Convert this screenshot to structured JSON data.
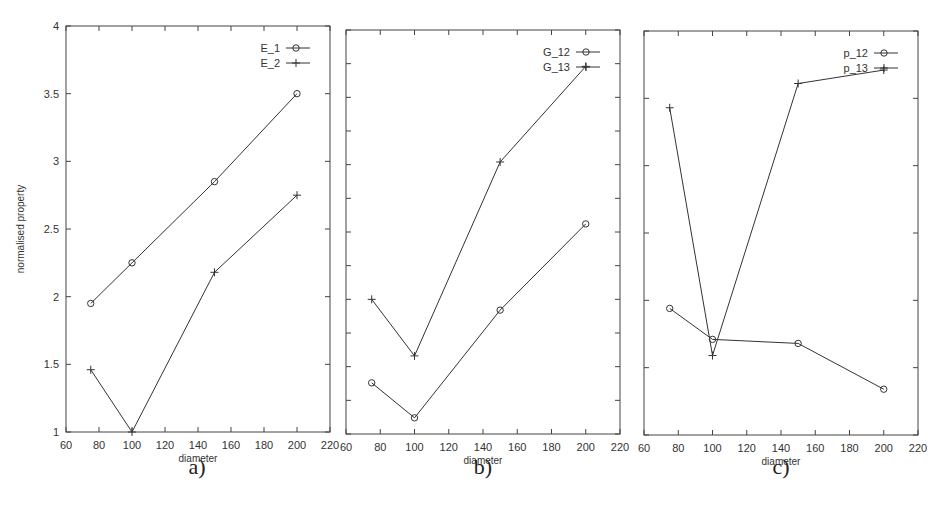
{
  "figure": {
    "panel_labels": [
      "a)",
      "b)",
      "c)"
    ],
    "xlabel": "diameter",
    "ylabel": "normalised property"
  },
  "chart_data": [
    {
      "type": "line",
      "panel": "a)",
      "title": "",
      "xlabel": "diameter",
      "ylabel": "normalised property",
      "xlim": [
        60,
        220
      ],
      "ylim": [
        1,
        4
      ],
      "x_ticks": [
        60,
        80,
        100,
        120,
        140,
        160,
        180,
        200,
        220
      ],
      "y_ticks": [
        1,
        1.5,
        2,
        2.5,
        3,
        3.5,
        4
      ],
      "y_tick_labels": [
        "1",
        "1.5",
        "2",
        "2.5",
        "3",
        "3.5",
        "4"
      ],
      "x": [
        75,
        100,
        150,
        200
      ],
      "series": [
        {
          "name": "E_1",
          "marker": "circle",
          "values": [
            1.95,
            2.25,
            2.85,
            3.5
          ]
        },
        {
          "name": "E_2",
          "marker": "plus",
          "values": [
            1.46,
            1.0,
            2.18,
            2.75
          ]
        }
      ],
      "legend_position": "upper right",
      "grid": false
    },
    {
      "type": "line",
      "panel": "b)",
      "title": "",
      "xlabel": "diameter",
      "ylabel": "",
      "xlim": [
        60,
        220
      ],
      "ylim": [
        1,
        4
      ],
      "x_ticks": [
        60,
        80,
        100,
        120,
        140,
        160,
        180,
        200,
        220
      ],
      "y_ticks_count": 13,
      "y_tick_labels": [],
      "x": [
        75,
        100,
        150,
        200
      ],
      "series": [
        {
          "name": "G_12",
          "marker": "circle",
          "values": [
            1.38,
            1.12,
            1.92,
            2.56
          ]
        },
        {
          "name": "G_13",
          "marker": "plus",
          "values": [
            2.0,
            1.58,
            3.02,
            3.73
          ]
        }
      ],
      "legend_position": "upper right",
      "grid": false
    },
    {
      "type": "line",
      "panel": "c)",
      "title": "",
      "xlabel": "diameter",
      "ylabel": "",
      "xlim": [
        60,
        220
      ],
      "ylim": [
        1,
        4
      ],
      "x_ticks": [
        60,
        80,
        100,
        120,
        140,
        160,
        180,
        200,
        220
      ],
      "y_ticks_count": 7,
      "y_tick_labels": [],
      "x": [
        75,
        100,
        150,
        200
      ],
      "series": [
        {
          "name": "p_12",
          "marker": "circle",
          "values": [
            1.94,
            1.71,
            1.68,
            1.34
          ]
        },
        {
          "name": "p_13",
          "marker": "plus",
          "values": [
            3.43,
            1.59,
            3.61,
            3.71
          ]
        }
      ],
      "legend_position": "upper right",
      "grid": false
    }
  ],
  "layout": {
    "panels": [
      {
        "x0": 66,
        "x1": 330,
        "y0": 26,
        "y1": 432,
        "label_x": 197,
        "label_y": 474
      },
      {
        "x0": 346,
        "x1": 620,
        "y0": 30,
        "y1": 434,
        "label_x": 483,
        "label_y": 474
      },
      {
        "x0": 644,
        "x1": 918,
        "y0": 31,
        "y1": 435,
        "label_x": 781,
        "label_y": 474
      }
    ],
    "line_color": "#333333",
    "frame_color": "#444444"
  }
}
